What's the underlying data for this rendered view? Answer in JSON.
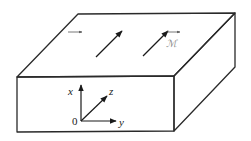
{
  "figure": {
    "colors": {
      "background": "#ffffff",
      "lines": "#2a2a2a",
      "script_labels": "#8a8a8a"
    }
  },
  "top_face": {
    "vector_B": {
      "label": "𝒝",
      "label_plain": "B",
      "has_vector_arrow": true
    },
    "vector_M": {
      "label": "ℳ",
      "label_plain": "M",
      "has_vector_arrow": true
    }
  },
  "axes": {
    "x_label": "x",
    "y_label": "y",
    "z_label": "z",
    "origin_label": "0"
  }
}
